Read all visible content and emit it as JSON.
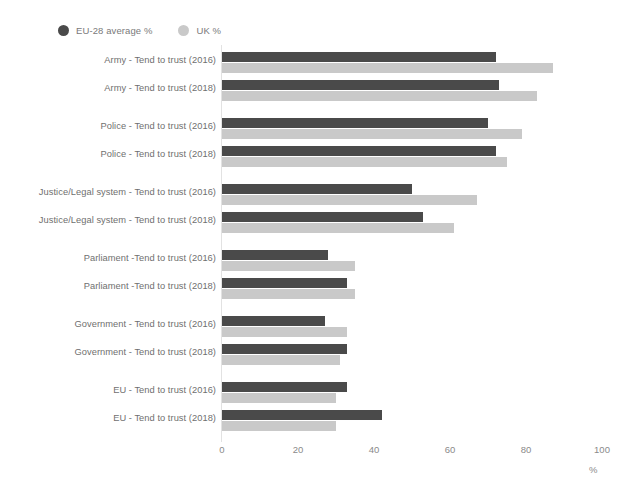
{
  "legend": {
    "items": [
      {
        "label": "EU-28 average %",
        "color": "#4a4a4a",
        "marker": "circle-marker"
      },
      {
        "label": "UK %",
        "color": "#c9c9c9",
        "marker": "circle-marker"
      }
    ]
  },
  "axis": {
    "unit_label": "%",
    "ticks": [
      "0",
      "20",
      "40",
      "60",
      "80",
      "100"
    ]
  },
  "chart_data": {
    "type": "bar",
    "orientation": "horizontal",
    "title": "",
    "xlabel": "%",
    "ylabel": "",
    "xlim": [
      0,
      100
    ],
    "xticks": [
      0,
      20,
      40,
      60,
      80,
      100
    ],
    "grid": false,
    "legend_position": "top-left",
    "series": [
      {
        "name": "EU-28 average %",
        "color": "#4a4a4a",
        "values": [
          72,
          73,
          70,
          72,
          50,
          53,
          28,
          33,
          27,
          33,
          33,
          42
        ]
      },
      {
        "name": "UK %",
        "color": "#c9c9c9",
        "values": [
          87,
          83,
          79,
          75,
          67,
          61,
          35,
          35,
          33,
          31,
          30,
          30
        ]
      }
    ],
    "categories": [
      "Army - Tend to trust (2016)",
      "Army - Tend to trust (2018)",
      "Police - Tend to trust (2016)",
      "Police - Tend to trust (2018)",
      "Justice/Legal system - Tend to trust (2016)",
      "Justice/Legal system - Tend to trust (2018)",
      "Parliament -Tend to trust (2016)",
      "Parliament -Tend to trust (2018)",
      "Government - Tend to trust (2016)",
      "Government - Tend to trust (2018)",
      "EU - Tend to trust (2016)",
      "EU - Tend to trust (2018)"
    ],
    "groups": [
      {
        "name": "Army",
        "rows": [
          {
            "label": "Army - Tend to trust (2016)",
            "eu": 72,
            "uk": 87
          },
          {
            "label": "Army - Tend to trust (2018)",
            "eu": 73,
            "uk": 83
          }
        ]
      },
      {
        "name": "Police",
        "rows": [
          {
            "label": "Police - Tend to trust (2016)",
            "eu": 70,
            "uk": 79
          },
          {
            "label": "Police - Tend to trust (2018)",
            "eu": 72,
            "uk": 75
          }
        ]
      },
      {
        "name": "Justice/Legal system",
        "rows": [
          {
            "label": "Justice/Legal system - Tend to trust (2016)",
            "eu": 50,
            "uk": 67
          },
          {
            "label": "Justice/Legal system - Tend to trust (2018)",
            "eu": 53,
            "uk": 61
          }
        ]
      },
      {
        "name": "Parliament",
        "rows": [
          {
            "label": "Parliament -Tend to trust (2016)",
            "eu": 28,
            "uk": 35
          },
          {
            "label": "Parliament -Tend to trust (2018)",
            "eu": 33,
            "uk": 35
          }
        ]
      },
      {
        "name": "Government",
        "rows": [
          {
            "label": "Government - Tend to trust (2016)",
            "eu": 27,
            "uk": 33
          },
          {
            "label": "Government - Tend to trust (2018)",
            "eu": 33,
            "uk": 31
          }
        ]
      },
      {
        "name": "EU",
        "rows": [
          {
            "label": "EU - Tend to trust (2016)",
            "eu": 33,
            "uk": 30
          },
          {
            "label": "EU - Tend to trust (2018)",
            "eu": 42,
            "uk": 30
          }
        ]
      }
    ]
  }
}
